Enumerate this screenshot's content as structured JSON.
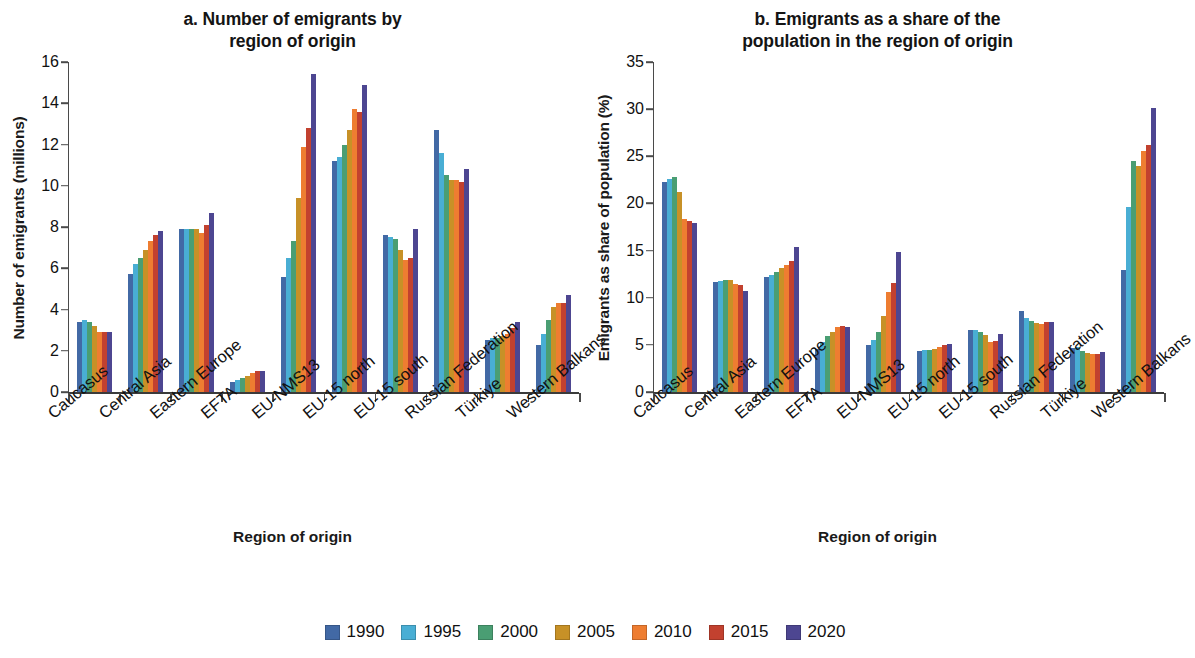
{
  "figure": {
    "legend_label": "Year series legend"
  },
  "panel_a": {
    "title_line1": "a. Number of emigrants by",
    "title_line2": "region of origin",
    "ylabel": "Number of emigrants (millions)",
    "xlabel": "Region of origin"
  },
  "panel_b": {
    "title_line1": "b. Emigrants as a share of the",
    "title_line2": "population in the region of origin",
    "ylabel": "Emigrants as share of population (%)",
    "xlabel": "Region of origin"
  },
  "legend": {
    "entries": [
      {
        "label": "1990",
        "color": "#4269a5"
      },
      {
        "label": "1995",
        "color": "#49aed4"
      },
      {
        "label": "2000",
        "color": "#4a9e73"
      },
      {
        "label": "2005",
        "color": "#c79127"
      },
      {
        "label": "2010",
        "color": "#ee7d31"
      },
      {
        "label": "2015",
        "color": "#c2412f"
      },
      {
        "label": "2020",
        "color": "#4d4691"
      }
    ]
  },
  "chart_data": [
    {
      "type": "bar",
      "id": "a",
      "title": "a. Number of emigrants by region of origin",
      "xlabel": "Region of origin",
      "ylabel": "Number of emigrants (millions)",
      "ylim": [
        0,
        16
      ],
      "yticks": [
        0,
        2,
        4,
        6,
        8,
        10,
        12,
        14,
        16
      ],
      "grid": false,
      "legend_position": "bottom-center",
      "categories": [
        "Caucasus",
        "Central Asia",
        "Eastern Europe",
        "EFTA",
        "EU-NMS13",
        "EU-15 north",
        "EU-15 south",
        "Russian Federation",
        "Türkiye",
        "Western Balkans"
      ],
      "series": [
        {
          "name": "1990",
          "color": "#4269a5",
          "values": [
            3.4,
            5.7,
            7.9,
            0.5,
            5.6,
            11.2,
            7.6,
            12.7,
            2.5,
            2.3
          ]
        },
        {
          "name": "1995",
          "color": "#49aed4",
          "values": [
            3.5,
            6.2,
            7.9,
            0.6,
            6.5,
            11.4,
            7.5,
            11.6,
            2.6,
            2.8
          ]
        },
        {
          "name": "2000",
          "color": "#4a9e73",
          "values": [
            3.4,
            6.5,
            7.9,
            0.7,
            7.3,
            12.0,
            7.4,
            10.5,
            2.6,
            3.5
          ]
        },
        {
          "name": "2005",
          "color": "#c79127",
          "values": [
            3.2,
            6.9,
            7.9,
            0.8,
            9.4,
            12.7,
            6.9,
            10.3,
            2.7,
            4.1
          ]
        },
        {
          "name": "2010",
          "color": "#ee7d31",
          "values": [
            2.9,
            7.3,
            7.7,
            0.9,
            11.9,
            13.7,
            6.4,
            10.3,
            2.8,
            4.3
          ]
        },
        {
          "name": "2015",
          "color": "#c2412f",
          "values": [
            2.9,
            7.6,
            8.1,
            1.0,
            12.8,
            13.6,
            6.5,
            10.2,
            3.1,
            4.3
          ]
        },
        {
          "name": "2020",
          "color": "#4d4691",
          "values": [
            2.9,
            7.8,
            8.7,
            1.0,
            15.4,
            14.9,
            7.9,
            10.8,
            3.4,
            4.7
          ]
        }
      ]
    },
    {
      "type": "bar",
      "id": "b",
      "title": "b. Emigrants as a share of the population in the region of origin",
      "xlabel": "Region of origin",
      "ylabel": "Emigrants as share of population (%)",
      "ylim": [
        0,
        35
      ],
      "yticks": [
        0,
        5,
        10,
        15,
        20,
        25,
        30,
        35
      ],
      "grid": false,
      "legend_position": "bottom-center",
      "categories": [
        "Caucasus",
        "Central Asia",
        "Eastern Europe",
        "EFTA",
        "EU-NMS13",
        "EU-15 north",
        "EU-15 south",
        "Russian Federation",
        "Türkiye",
        "Western Balkans"
      ],
      "series": [
        {
          "name": "1990",
          "color": "#4269a5",
          "values": [
            22.3,
            11.7,
            12.2,
            4.6,
            5.0,
            4.4,
            6.6,
            8.6,
            4.7,
            12.9
          ]
        },
        {
          "name": "1995",
          "color": "#49aed4",
          "values": [
            22.6,
            11.8,
            12.4,
            5.3,
            5.5,
            4.5,
            6.6,
            7.9,
            4.8,
            19.6
          ]
        },
        {
          "name": "2000",
          "color": "#4a9e73",
          "values": [
            22.8,
            11.9,
            12.7,
            5.9,
            6.4,
            4.5,
            6.4,
            7.5,
            4.4,
            24.5
          ]
        },
        {
          "name": "2005",
          "color": "#c79127",
          "values": [
            21.2,
            11.9,
            13.2,
            6.4,
            8.1,
            4.6,
            6.1,
            7.3,
            4.1,
            24.0
          ]
        },
        {
          "name": "2010",
          "color": "#ee7d31",
          "values": [
            18.4,
            11.5,
            13.5,
            6.9,
            10.6,
            4.8,
            5.3,
            7.2,
            4.0,
            25.6
          ]
        },
        {
          "name": "2015",
          "color": "#c2412f",
          "values": [
            18.1,
            11.3,
            13.9,
            7.0,
            11.6,
            5.0,
            5.4,
            7.4,
            4.0,
            26.2
          ]
        },
        {
          "name": "2020",
          "color": "#4d4691",
          "values": [
            17.9,
            10.7,
            15.4,
            6.9,
            14.8,
            5.1,
            6.2,
            7.4,
            4.2,
            30.1
          ]
        }
      ]
    }
  ]
}
